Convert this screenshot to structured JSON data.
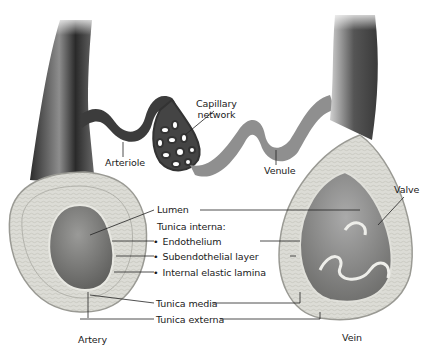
{
  "diagram": {
    "vessels": {
      "artery": "Artery",
      "vein": "Vein",
      "arteriole": "Arteriole",
      "venule": "Venule",
      "capillary_line1": "Capillary",
      "capillary_line2": "network",
      "valve": "Valve"
    },
    "layers": {
      "lumen": "Lumen",
      "tunica_interna": "Tunica interna:",
      "endothelium": "Endothelium",
      "subendothelial": "Subendothelial layer",
      "internal_elastic": "Internal elastic lamina",
      "tunica_media": "Tunica media",
      "tunica_externa": "Tunica externa"
    },
    "colors": {
      "background": "#ffffff",
      "vessel_dark": "#3a3a3a",
      "vessel_mid": "#8a8a8a",
      "wall_light": "#d9d9d4",
      "lumen": "#7a7a78",
      "leader_line": "#222222"
    }
  }
}
